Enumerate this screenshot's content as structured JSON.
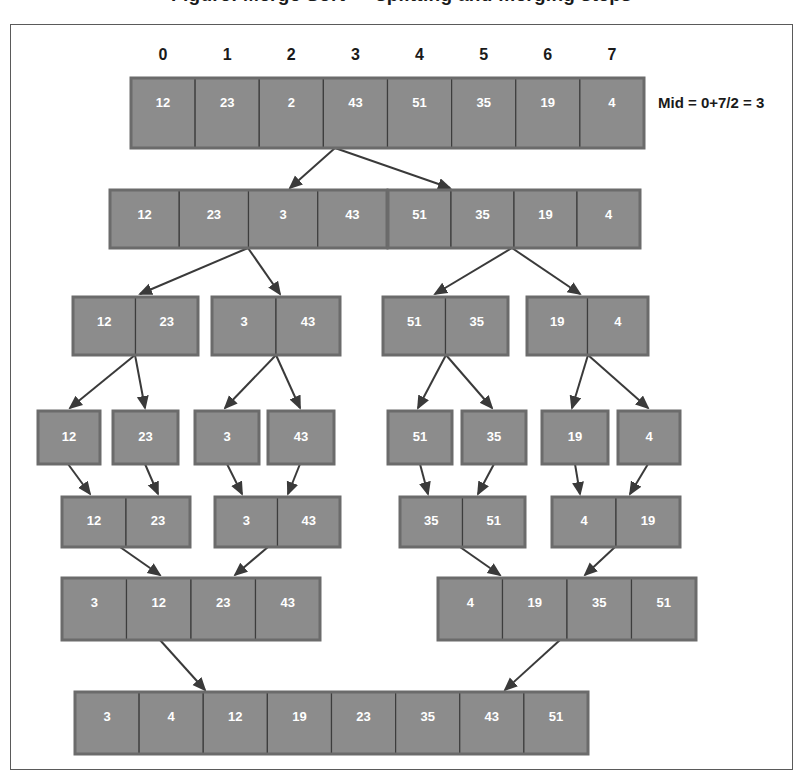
{
  "title": "Figure: Merge Sort — splitting and merging steps",
  "mid_label": "Mid = 0+7/2 = 3",
  "index_labels": [
    "0",
    "1",
    "2",
    "3",
    "4",
    "5",
    "6",
    "7"
  ],
  "colors": {
    "cell_fill": "#8c8c8c",
    "cell_stroke": "#3d3d3d",
    "cell_text": "#ffffff",
    "frame_border": "#5a5a5a",
    "arrow": "#3a3a3a",
    "background": "#ffffff"
  },
  "diagram": {
    "type": "merge-sort-tree",
    "phase_split_rows": 4,
    "phase_merge_rows": 3,
    "rows": [
      {
        "row": 0,
        "phase": "split",
        "arrays": [
          {
            "id": "r0a0",
            "values": [
              "12",
              "23",
              "2",
              "43",
              "51",
              "35",
              "19",
              "4"
            ],
            "x": 131,
            "y": 78,
            "w": 513,
            "h": 70
          }
        ]
      },
      {
        "row": 1,
        "phase": "split",
        "arrays": [
          {
            "id": "r1a0",
            "values": [
              "12",
              "23",
              "3",
              "43"
            ],
            "x": 110,
            "y": 190,
            "w": 277,
            "h": 58
          },
          {
            "id": "r1a1",
            "values": [
              "51",
              "35",
              "19",
              "4"
            ],
            "x": 388,
            "y": 190,
            "w": 252,
            "h": 58
          }
        ]
      },
      {
        "row": 2,
        "phase": "split",
        "arrays": [
          {
            "id": "r2a0",
            "values": [
              "12",
              "23"
            ],
            "x": 73,
            "y": 297,
            "w": 125,
            "h": 58
          },
          {
            "id": "r2a1",
            "values": [
              "3",
              "43"
            ],
            "x": 212,
            "y": 297,
            "w": 128,
            "h": 58
          },
          {
            "id": "r2a2",
            "values": [
              "51",
              "35"
            ],
            "x": 383,
            "y": 297,
            "w": 125,
            "h": 58
          },
          {
            "id": "r2a3",
            "values": [
              "19",
              "4"
            ],
            "x": 527,
            "y": 297,
            "w": 121,
            "h": 58
          }
        ]
      },
      {
        "row": 3,
        "phase": "split",
        "arrays": [
          {
            "id": "r3a0",
            "values": [
              "12"
            ],
            "x": 38,
            "y": 411,
            "w": 62,
            "h": 53
          },
          {
            "id": "r3a1",
            "values": [
              "23"
            ],
            "x": 113,
            "y": 411,
            "w": 65,
            "h": 53
          },
          {
            "id": "r3a2",
            "values": [
              "3"
            ],
            "x": 195,
            "y": 411,
            "w": 64,
            "h": 53
          },
          {
            "id": "r3a3",
            "values": [
              "43"
            ],
            "x": 268,
            "y": 411,
            "w": 66,
            "h": 53
          },
          {
            "id": "r3a4",
            "values": [
              "51"
            ],
            "x": 388,
            "y": 411,
            "w": 64,
            "h": 53
          },
          {
            "id": "r3a5",
            "values": [
              "35"
            ],
            "x": 462,
            "y": 411,
            "w": 64,
            "h": 53
          },
          {
            "id": "r3a6",
            "values": [
              "19"
            ],
            "x": 542,
            "y": 411,
            "w": 66,
            "h": 53
          },
          {
            "id": "r3a7",
            "values": [
              "4"
            ],
            "x": 618,
            "y": 411,
            "w": 62,
            "h": 53
          }
        ]
      },
      {
        "row": 4,
        "phase": "merge",
        "arrays": [
          {
            "id": "r4a0",
            "values": [
              "12",
              "23"
            ],
            "x": 62,
            "y": 497,
            "w": 128,
            "h": 50
          },
          {
            "id": "r4a1",
            "values": [
              "3",
              "43"
            ],
            "x": 215,
            "y": 497,
            "w": 125,
            "h": 50
          },
          {
            "id": "r4a2",
            "values": [
              "35",
              "51"
            ],
            "x": 400,
            "y": 497,
            "w": 125,
            "h": 50
          },
          {
            "id": "r4a3",
            "values": [
              "4",
              "19"
            ],
            "x": 552,
            "y": 497,
            "w": 128,
            "h": 50
          }
        ]
      },
      {
        "row": 5,
        "phase": "merge",
        "arrays": [
          {
            "id": "r5a0",
            "values": [
              "3",
              "12",
              "23",
              "43"
            ],
            "x": 62,
            "y": 578,
            "w": 258,
            "h": 62
          },
          {
            "id": "r5a1",
            "values": [
              "4",
              "19",
              "35",
              "51"
            ],
            "x": 438,
            "y": 578,
            "w": 258,
            "h": 62
          }
        ]
      },
      {
        "row": 6,
        "phase": "merge",
        "arrays": [
          {
            "id": "r6a0",
            "values": [
              "3",
              "4",
              "12",
              "19",
              "23",
              "35",
              "43",
              "51"
            ],
            "x": 75,
            "y": 692,
            "w": 513,
            "h": 62
          }
        ]
      }
    ],
    "arrows": [
      {
        "from": [
          335,
          148
        ],
        "to": [
          290,
          188
        ],
        "dir": "down-left"
      },
      {
        "from": [
          335,
          148
        ],
        "to": [
          450,
          188
        ],
        "dir": "down-right"
      },
      {
        "from": [
          248,
          248
        ],
        "to": [
          140,
          294
        ],
        "dir": "down-left"
      },
      {
        "from": [
          248,
          248
        ],
        "to": [
          280,
          294
        ],
        "dir": "down-right"
      },
      {
        "from": [
          512,
          248
        ],
        "to": [
          435,
          294
        ],
        "dir": "down-left"
      },
      {
        "from": [
          512,
          248
        ],
        "to": [
          580,
          294
        ],
        "dir": "down-right"
      },
      {
        "from": [
          135,
          355
        ],
        "to": [
          70,
          408
        ],
        "dir": "down-left"
      },
      {
        "from": [
          135,
          355
        ],
        "to": [
          145,
          408
        ],
        "dir": "down-right"
      },
      {
        "from": [
          276,
          355
        ],
        "to": [
          225,
          408
        ],
        "dir": "down-left"
      },
      {
        "from": [
          276,
          355
        ],
        "to": [
          300,
          408
        ],
        "dir": "down-right"
      },
      {
        "from": [
          446,
          355
        ],
        "to": [
          418,
          408
        ],
        "dir": "down-left"
      },
      {
        "from": [
          446,
          355
        ],
        "to": [
          492,
          408
        ],
        "dir": "down-right"
      },
      {
        "from": [
          588,
          355
        ],
        "to": [
          572,
          408
        ],
        "dir": "down-left"
      },
      {
        "from": [
          588,
          355
        ],
        "to": [
          648,
          408
        ],
        "dir": "down-right"
      },
      {
        "from": [
          68,
          464
        ],
        "to": [
          90,
          494
        ],
        "dir": "down-right"
      },
      {
        "from": [
          145,
          464
        ],
        "to": [
          158,
          494
        ],
        "dir": "down-right"
      },
      {
        "from": [
          227,
          464
        ],
        "to": [
          242,
          494
        ],
        "dir": "down-right"
      },
      {
        "from": [
          300,
          464
        ],
        "to": [
          288,
          494
        ],
        "dir": "down-left"
      },
      {
        "from": [
          420,
          464
        ],
        "to": [
          428,
          494
        ],
        "dir": "down-right"
      },
      {
        "from": [
          494,
          464
        ],
        "to": [
          478,
          494
        ],
        "dir": "down-left"
      },
      {
        "from": [
          575,
          464
        ],
        "to": [
          580,
          494
        ],
        "dir": "down-right"
      },
      {
        "from": [
          648,
          464
        ],
        "to": [
          630,
          494
        ],
        "dir": "down-left"
      },
      {
        "from": [
          120,
          547
        ],
        "to": [
          160,
          575
        ],
        "dir": "down-right"
      },
      {
        "from": [
          268,
          547
        ],
        "to": [
          235,
          575
        ],
        "dir": "down-left"
      },
      {
        "from": [
          460,
          547
        ],
        "to": [
          500,
          575
        ],
        "dir": "down-right"
      },
      {
        "from": [
          615,
          547
        ],
        "to": [
          585,
          575
        ],
        "dir": "down-left"
      },
      {
        "from": [
          160,
          640
        ],
        "to": [
          205,
          690
        ],
        "dir": "down-right"
      },
      {
        "from": [
          560,
          640
        ],
        "to": [
          505,
          690
        ],
        "dir": "down-left"
      }
    ]
  }
}
